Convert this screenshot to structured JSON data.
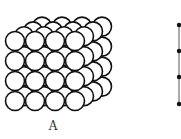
{
  "figure": {
    "type": "sphere-packing-diagram",
    "panels": [
      {
        "label": "A",
        "description": "simple cubic stacking of spheres",
        "grid": {
          "cols": 4,
          "rows": 4,
          "layers": 4
        },
        "front_origin": [
          15,
          41
        ],
        "spacing": 20,
        "radius": 9.5,
        "layer_offset": [
          9,
          -4.8
        ]
      },
      {
        "description": "side view line with four points",
        "line_x": 179,
        "points_y": [
          25,
          51,
          77,
          104
        ]
      }
    ],
    "stroke_color": "#111111",
    "fill_color": "#ffffff"
  }
}
